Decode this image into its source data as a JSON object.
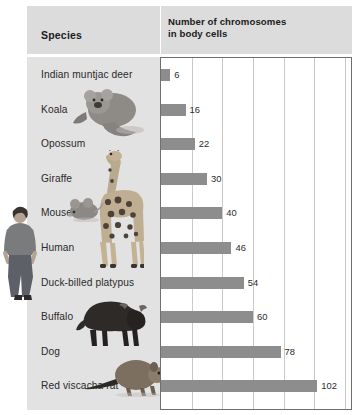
{
  "header": {
    "species_label": "Species",
    "value_label_line1": "Number of chromosomes",
    "value_label_line2": "in body cells"
  },
  "colors": {
    "bar": "#8d8d8d",
    "header_bg": "#dcdcdc",
    "panel_bg": "#e2e2e2",
    "gridline": "#c9c9c9",
    "plot_border": "#6f6f6f",
    "text": "#2a2a2a"
  },
  "chart_data": {
    "type": "bar",
    "orientation": "horizontal",
    "title": "Number of chromosomes in body cells",
    "xlabel": "Number of chromosomes in body cells",
    "ylabel": "Species",
    "categories": [
      "Indian muntjac deer",
      "Koala",
      "Opossum",
      "Giraffe",
      "Mouse",
      "Human",
      "Duck-billed platypus",
      "Buffalo",
      "Dog",
      "Red viscacha rat"
    ],
    "values": [
      6,
      16,
      22,
      30,
      40,
      46,
      54,
      60,
      78,
      102
    ],
    "xlim": [
      0,
      124
    ],
    "gridlines": [
      20,
      40,
      60,
      80,
      100,
      120
    ],
    "grid": true,
    "legend": "none",
    "data_labels": [
      "6",
      "16",
      "22",
      "30",
      "40",
      "46",
      "54",
      "60",
      "78",
      "102"
    ]
  },
  "artwork": [
    {
      "name": "koala-photo",
      "species": "Koala"
    },
    {
      "name": "giraffe-photo",
      "species": "Giraffe"
    },
    {
      "name": "mouse-photo",
      "species": "Mouse"
    },
    {
      "name": "human-photo",
      "species": "Human"
    },
    {
      "name": "buffalo-photo",
      "species": "Buffalo"
    },
    {
      "name": "red-viscacha-rat-photo",
      "species": "Red viscacha rat"
    }
  ]
}
